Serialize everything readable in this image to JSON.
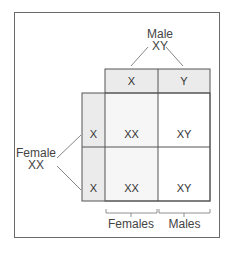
{
  "diagram": {
    "male_parent": {
      "label": "Male",
      "genotype": "XY"
    },
    "female_parent": {
      "label": "Female",
      "genotype": "XX"
    },
    "male_gametes": [
      "X",
      "Y"
    ],
    "female_gametes": [
      "X",
      "X"
    ],
    "offspring": [
      [
        "XX",
        "XY"
      ],
      [
        "XX",
        "XY"
      ]
    ],
    "groups": {
      "females": "Females",
      "males": "Males"
    },
    "colors": {
      "shaded": "#ebebeb",
      "light_shaded": "#f4f4f4",
      "line": "#555555"
    }
  }
}
